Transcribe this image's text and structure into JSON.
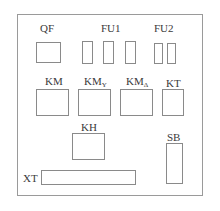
{
  "diagram": {
    "type": "electrical-panel-layout",
    "components": [
      {
        "id": "QF",
        "label": "QF",
        "sub": ""
      },
      {
        "id": "FU1",
        "label": "FU1",
        "sub": "",
        "count": 3
      },
      {
        "id": "FU2",
        "label": "FU2",
        "sub": "",
        "count": 2
      },
      {
        "id": "KM",
        "label": "KM",
        "sub": ""
      },
      {
        "id": "KMY",
        "label": "KM",
        "sub": "Y"
      },
      {
        "id": "KMD",
        "label": "KM",
        "sub": "Δ"
      },
      {
        "id": "KT",
        "label": "KT",
        "sub": ""
      },
      {
        "id": "KH",
        "label": "KH",
        "sub": ""
      },
      {
        "id": "SB",
        "label": "SB",
        "sub": ""
      },
      {
        "id": "XT",
        "label": "XT",
        "sub": ""
      }
    ]
  }
}
